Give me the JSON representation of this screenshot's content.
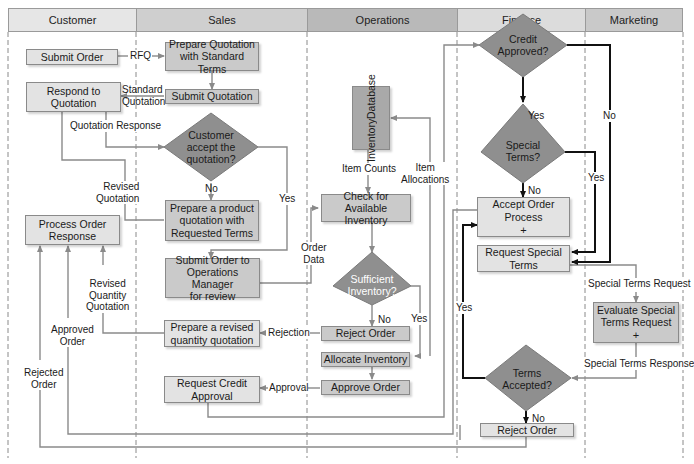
{
  "lanes": [
    {
      "name": "Customer",
      "color": "#e6e6e6"
    },
    {
      "name": "Sales",
      "color": "#cfcfcf"
    },
    {
      "name": "Operations",
      "color": "#b7b7b7"
    },
    {
      "name": "Finance",
      "color": "#dcdcdc"
    },
    {
      "name": "Marketing",
      "color": "#c9c9c9"
    }
  ],
  "customer": {
    "submit_order": "Submit Order",
    "respond_to_quotation": [
      "Respond to",
      "Quotation"
    ],
    "process_order_response": [
      "Process Order",
      "Response"
    ]
  },
  "sales": {
    "prepare_quotation": [
      "Prepare Quotation",
      "with Standard Terms"
    ],
    "submit_quotation": "Submit Quotation",
    "customer_accept": [
      "Customer",
      "accept the",
      "quotation?"
    ],
    "prepare_product_quotation": [
      "Prepare a product",
      "quotation with",
      "Requested Terms"
    ],
    "submit_order_ops": [
      "Submit Order to",
      "Operations Manager",
      "for review"
    ],
    "prepare_revised_qty": [
      "Prepare a revised",
      "quantity quotation"
    ],
    "request_credit": [
      "Request Credit",
      "Approval"
    ]
  },
  "operations": {
    "inventory_db": [
      "Inventory",
      "Database"
    ],
    "check_inventory": [
      "Check for",
      "Available Inventory"
    ],
    "sufficient_inventory": [
      "Sufficient",
      "Inventory?"
    ],
    "reject_order": "Reject Order",
    "allocate_inventory": "Allocate Inventory",
    "approve_order": "Approve Order"
  },
  "finance": {
    "credit_approved": [
      "Credit",
      "Approved?"
    ],
    "special_terms": [
      "Special",
      "Terms?"
    ],
    "accept_order": [
      "Accept Order",
      "Process",
      "+"
    ],
    "request_special_terms": [
      "Request Special",
      "Terms"
    ],
    "terms_accepted": [
      "Terms",
      "Accepted?"
    ],
    "reject_order": "Reject Order"
  },
  "marketing": {
    "evaluate_special": [
      "Evaluate Special",
      "Terms Request",
      "+"
    ]
  },
  "edge_labels": {
    "rfq": "RFQ",
    "standard_quotation": [
      "Standard",
      "Quotation"
    ],
    "quotation_response": "Quotation Response",
    "revised_quotation": [
      "Revised",
      "Quotation"
    ],
    "no_accept": "No",
    "yes_accept": "Yes",
    "item_counts": "Item Counts",
    "item_allocations": [
      "Item",
      "Allocations"
    ],
    "order_data": [
      "Order",
      "Data"
    ],
    "no_inventory": "No",
    "yes_inventory": "Yes",
    "rejection": "Rejection",
    "approval": "Approval",
    "revised_qty_quotation": [
      "Revised",
      "Quantity",
      "Quotation"
    ],
    "approved_order": [
      "Approved",
      "Order"
    ],
    "rejected_order": [
      "Rejected",
      "Order"
    ],
    "yes_credit": "Yes",
    "no_credit": "No",
    "no_special": "No",
    "yes_special": "Yes",
    "yes_terms": "Yes",
    "no_terms": "No",
    "special_terms_request": "Special Terms Request",
    "special_terms_response": "Special Terms Response"
  }
}
